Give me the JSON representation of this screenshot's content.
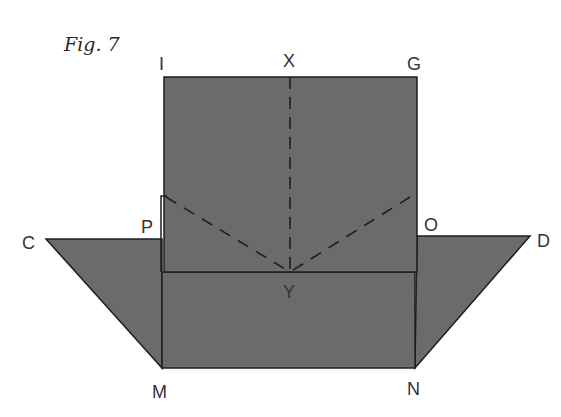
{
  "figure": {
    "caption": "Fig. 7",
    "colors": {
      "fill": "#6b6b6b",
      "stroke": "#1e1e1e",
      "label": "#333333",
      "background": "#ffffff"
    },
    "labels": {
      "I": "I",
      "X": "X",
      "G": "G",
      "P": "P",
      "O": "O",
      "C": "C",
      "D": "D",
      "Y": "Y",
      "M": "M",
      "N": "N"
    },
    "shapes": [
      {
        "name": "square-IG",
        "type": "rect",
        "corners": [
          "I",
          "G",
          "O",
          "P"
        ]
      },
      {
        "name": "rect-MN",
        "type": "rect",
        "corners": [
          "P",
          "O",
          "N",
          "M"
        ]
      },
      {
        "name": "triangle-left",
        "type": "triangle",
        "vertices": [
          "C",
          "P",
          "M"
        ]
      },
      {
        "name": "triangle-right",
        "type": "triangle",
        "vertices": [
          "O",
          "D",
          "N"
        ]
      }
    ],
    "dashed_lines": [
      {
        "from": "X",
        "to": "Y"
      },
      {
        "from": "P",
        "to": "Y"
      },
      {
        "from": "O",
        "to": "Y"
      }
    ]
  }
}
